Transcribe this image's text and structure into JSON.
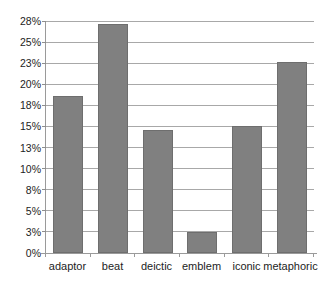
{
  "chart_data": {
    "type": "bar",
    "title": "",
    "subtitle": "",
    "xlabel": "",
    "ylabel": "",
    "categories": [
      "adaptor",
      "beat",
      "deictic",
      "emblem",
      "iconic",
      "metaphoric"
    ],
    "values": [
      18.6,
      27.2,
      14.6,
      2.5,
      15.1,
      22.6
    ],
    "value_labels": [
      "18.6%",
      "27.2%",
      "14.6%",
      "2.5%",
      "15.1%",
      "22.6%"
    ],
    "series": [
      {
        "name": "percentage",
        "values": [
          18.6,
          27.2,
          14.6,
          2.5,
          15.1,
          22.6
        ]
      }
    ],
    "ylim": [
      0,
      27.5
    ],
    "ytick_values": [
      0,
      2.5,
      5,
      7.5,
      10,
      12.5,
      15,
      17.5,
      20,
      22.5,
      25,
      27.5
    ],
    "ytick_labels": [
      "0%",
      "3%",
      "5%",
      "8%",
      "10%",
      "13%",
      "15%",
      "18%",
      "20%",
      "23%",
      "25%",
      "28%"
    ],
    "grid": true,
    "grid_axis": "y",
    "legend": false,
    "legend_position": "none",
    "bar_color": "#808080",
    "bar_border_color": "#6e6e6e",
    "gridline_color": "#a8a8a8",
    "axis_color": "#9a9a9a",
    "background_color": "#ffffff",
    "text_color": "#1d1d1d",
    "annotations": []
  }
}
